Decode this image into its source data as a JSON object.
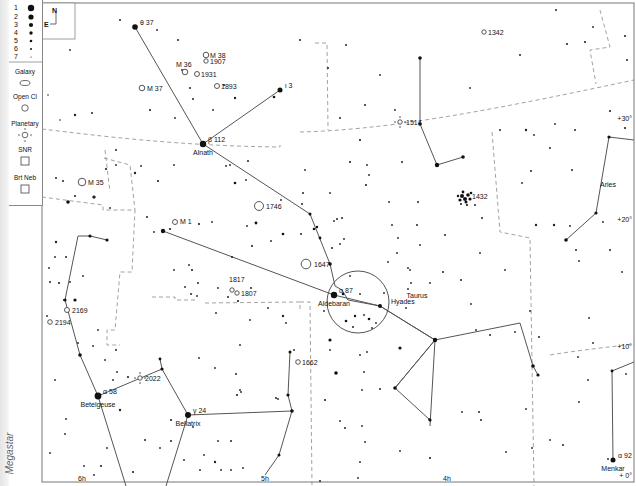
{
  "app": {
    "watermark": "Megastar"
  },
  "legend": {
    "magnitudes": [
      "1",
      "2",
      "3",
      "4",
      "5",
      "6",
      "7"
    ],
    "object_types": [
      {
        "label": "Galaxy",
        "symbol": "ellipse"
      },
      {
        "label": "Open Cl",
        "symbol": "circle"
      },
      {
        "label": "Planetary",
        "symbol": "circle-cross"
      },
      {
        "label": "SNR",
        "symbol": "square"
      },
      {
        "label": "Brt Neb",
        "symbol": "square"
      }
    ]
  },
  "orientation": {
    "north": "N",
    "east": "E"
  },
  "grid_labels": {
    "ra": [
      {
        "label": "6h",
        "x": 82
      },
      {
        "label": "5h",
        "x": 265
      },
      {
        "label": "4h",
        "x": 447
      }
    ],
    "dec": [
      {
        "label": "+30°",
        "y": 121
      },
      {
        "label": "+20°",
        "y": 222
      },
      {
        "label": "+10°",
        "y": 349
      },
      {
        "label": "+ 0°",
        "y": 478
      }
    ]
  },
  "constellations": [
    {
      "label": "Taurus",
      "x": 417,
      "y": 298
    },
    {
      "label": "Aries",
      "x": 608,
      "y": 187
    }
  ],
  "named_stars": [
    {
      "greek": "θ 37",
      "name": "",
      "x": 135,
      "y": 27
    },
    {
      "greek": "ι 3",
      "name": "",
      "x": 280,
      "y": 90
    },
    {
      "greek": "β 112",
      "name": "Alnath",
      "x": 203,
      "y": 144
    },
    {
      "greek": "α 87",
      "name": "Aldebaran",
      "x": 334,
      "y": 295
    },
    {
      "greek": "α 58",
      "name": "Betelgeuse",
      "x": 98,
      "y": 396
    },
    {
      "greek": "γ 24",
      "name": "Bellatrix",
      "x": 188,
      "y": 415
    },
    {
      "greek": "α 92",
      "name": "Menkar",
      "x": 613,
      "y": 460
    }
  ],
  "deep_sky_objects": [
    {
      "label": "M 38",
      "type": "open",
      "x": 206,
      "y": 55
    },
    {
      "label": "1907",
      "type": "open",
      "x": 206,
      "y": 61
    },
    {
      "label": "M 36",
      "type": "open",
      "x": 185,
      "y": 72
    },
    {
      "label": "1931",
      "type": "open",
      "x": 197,
      "y": 74
    },
    {
      "label": "1893",
      "type": "open",
      "x": 217,
      "y": 86
    },
    {
      "label": "M 37",
      "type": "open",
      "x": 142,
      "y": 88
    },
    {
      "label": "1342",
      "type": "open",
      "x": 484,
      "y": 32
    },
    {
      "label": "1514",
      "type": "planetary",
      "x": 400,
      "y": 122
    },
    {
      "label": "M 35",
      "type": "open",
      "x": 82,
      "y": 182
    },
    {
      "label": "1746",
      "type": "open",
      "x": 259,
      "y": 206
    },
    {
      "label": "M 1",
      "type": "snr",
      "x": 175,
      "y": 222
    },
    {
      "label": "1432",
      "type": "cluster",
      "x": 465,
      "y": 197
    },
    {
      "label": "1647",
      "type": "open",
      "x": 306,
      "y": 264
    },
    {
      "label": "Hyades",
      "type": "open",
      "x": 355,
      "y": 300
    },
    {
      "label": "1817",
      "type": "open",
      "x": 232,
      "y": 290
    },
    {
      "label": "1807",
      "type": "open",
      "x": 237,
      "y": 293
    },
    {
      "label": "2169",
      "type": "open",
      "x": 67,
      "y": 310
    },
    {
      "label": "2194",
      "type": "open",
      "x": 50,
      "y": 322
    },
    {
      "label": "1662",
      "type": "open",
      "x": 298,
      "y": 362
    },
    {
      "label": "2022",
      "type": "planetary",
      "x": 140,
      "y": 378
    }
  ],
  "colors": {
    "line": "#555555",
    "boundary": "#8a8a8a",
    "star": "#111111",
    "text": "#111111"
  }
}
